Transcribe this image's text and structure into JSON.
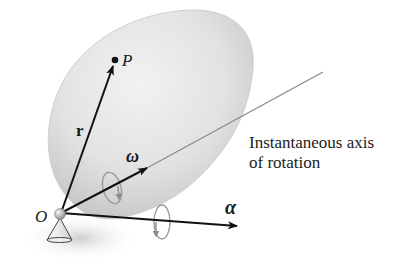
{
  "diagram": {
    "labels": {
      "point": "P",
      "position_vector": "r",
      "angular_velocity": "ω",
      "angular_acceleration": "α",
      "origin": "O"
    },
    "caption": {
      "line1": "Instantaneous axis",
      "line2": "of rotation"
    },
    "colors": {
      "body_fill": "#d9d9d9",
      "body_edge": "#c4c4c4",
      "vector": "#111111",
      "axis_line": "#8a8a8a",
      "rotation_arrow": "#8c8c8c",
      "background": "#ffffff"
    }
  }
}
